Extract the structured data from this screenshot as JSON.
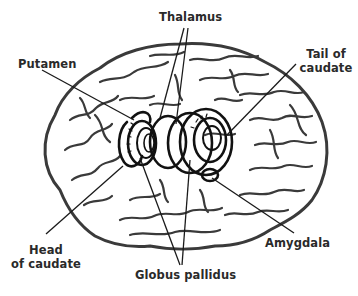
{
  "figure": {
    "colors": {
      "outline": "#3a3a3a",
      "leader_line": "#1a1a1a",
      "label_text": "#2a2a2a",
      "background": "#ffffff"
    },
    "labels": {
      "thalamus": "Thalamus",
      "putamen": "Putamen",
      "tail_of_caudate_line1": "Tail of",
      "tail_of_caudate_line2": "caudate",
      "head_of_caudate_line1": "Head",
      "head_of_caudate_line2": "of caudate",
      "globus_pallidus": "Globus pallidus",
      "amygdala": "Amygdala"
    }
  }
}
